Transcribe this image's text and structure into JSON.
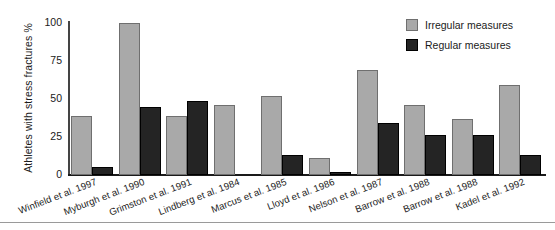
{
  "chart_data": {
    "type": "bar",
    "title": "",
    "xlabel": "",
    "ylabel": "Athletes with stress fractures %",
    "ylim": [
      0,
      100
    ],
    "yticks": [
      0,
      25,
      50,
      75,
      100
    ],
    "grid": false,
    "legend_position": "top-right",
    "categories": [
      "Winfield et al. 1997",
      "Myburgh et al. 1990",
      "Grimston et al. 1991",
      "Lindberg et al. 1984",
      "Marcus et al. 1985",
      "Lloyd et al. 1986",
      "Nelson et al. 1987",
      "Barrow et al. 1988",
      "Barrow et al. 1988",
      "Kadel et al. 1992"
    ],
    "series": [
      {
        "name": "Irregular measures",
        "color": "#a9a9a9",
        "values": [
          39,
          100,
          39,
          46,
          52,
          11,
          69,
          46,
          37,
          59
        ]
      },
      {
        "name": "Regular measures",
        "color": "#242424",
        "values": [
          5,
          45,
          49,
          null,
          13,
          2,
          34,
          26,
          26,
          13
        ]
      }
    ]
  },
  "legend": {
    "entries": [
      {
        "label": "Irregular measures",
        "swatch": "irregular"
      },
      {
        "label": "Regular measures",
        "swatch": "regular"
      }
    ]
  }
}
